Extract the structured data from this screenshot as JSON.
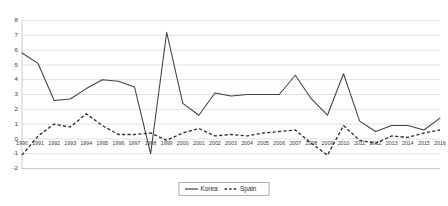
{
  "chart_data": {
    "type": "line",
    "title": "",
    "xlabel": "",
    "ylabel": "",
    "ylim": [
      -2,
      8
    ],
    "xlim": [
      1990,
      2016
    ],
    "grid": true,
    "legend_position": "bottom-center",
    "ytick_labels": [
      "8",
      "7",
      "6",
      "5",
      "4",
      "3",
      "2",
      "1",
      "0",
      "-1",
      "-2"
    ],
    "yticks": [
      8,
      7,
      6,
      5,
      4,
      3,
      2,
      1,
      0,
      -1,
      -2
    ],
    "categories": [
      "1990",
      "1991",
      "1992",
      "1993",
      "1994",
      "1995",
      "1996",
      "1997",
      "1998",
      "1999",
      "2000",
      "2001",
      "2002",
      "2003",
      "2004",
      "2005",
      "2006",
      "2007",
      "2008",
      "2009",
      "2010",
      "2011",
      "2012",
      "2013",
      "2014",
      "2015",
      "2016"
    ],
    "x": [
      1990,
      1991,
      1992,
      1993,
      1994,
      1995,
      1996,
      1997,
      1998,
      1999,
      2000,
      2001,
      2002,
      2003,
      2004,
      2005,
      2006,
      2007,
      2008,
      2009,
      2010,
      2011,
      2012,
      2013,
      2014,
      2015,
      2016
    ],
    "series": [
      {
        "name": "Korea",
        "style": "solid",
        "color": "#404040",
        "values": [
          5.8,
          5.1,
          2.6,
          2.7,
          3.4,
          4.0,
          3.9,
          3.5,
          -1.0,
          7.2,
          2.4,
          1.6,
          3.1,
          2.9,
          3.0,
          3.0,
          3.0,
          4.3,
          2.7,
          1.6,
          4.4,
          1.2,
          0.5,
          0.9,
          0.9,
          0.6,
          1.4
        ]
      },
      {
        "name": "Spain",
        "style": "dashed",
        "color": "#303030",
        "values": [
          -1.1,
          0.2,
          1.0,
          0.8,
          1.7,
          0.9,
          0.3,
          0.3,
          0.4,
          -0.1,
          0.4,
          0.7,
          0.2,
          0.3,
          0.2,
          0.4,
          0.5,
          0.6,
          -0.3,
          -1.1,
          0.9,
          -0.1,
          -0.3,
          0.2,
          0.1,
          0.4,
          0.6
        ]
      }
    ]
  },
  "legend": {
    "items": [
      {
        "label": "Korea",
        "style": "solid"
      },
      {
        "label": "Spain",
        "style": "dashed"
      }
    ]
  }
}
